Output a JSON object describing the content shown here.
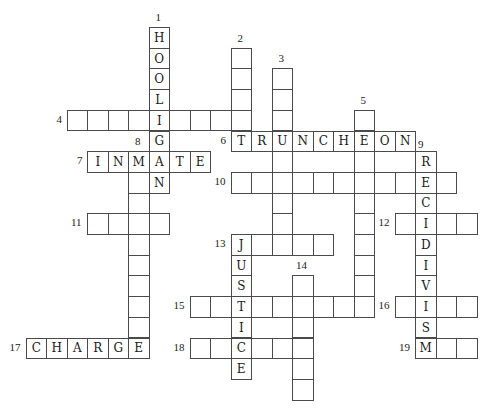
{
  "puzzle": {
    "grid": {
      "x0": 25.5,
      "y0": 27,
      "cell_w": 20.5,
      "cell_h": 20.7
    },
    "entries": [
      {
        "number": "1",
        "direction": "down",
        "row": 0,
        "col": 6,
        "length": 8,
        "letters": "HOOLIGAN",
        "label_pos": "above"
      },
      {
        "number": "2",
        "direction": "down",
        "row": 1,
        "col": 10,
        "length": 5,
        "letters": "",
        "label_pos": "above"
      },
      {
        "number": "3",
        "direction": "down",
        "row": 2,
        "col": 12,
        "length": 9,
        "letters": "",
        "label_pos": "above"
      },
      {
        "number": "4",
        "direction": "across",
        "row": 4,
        "col": 2,
        "length": 9,
        "letters": "",
        "label_pos": "left"
      },
      {
        "number": "5",
        "direction": "down",
        "row": 4,
        "col": 16,
        "length": 10,
        "letters": "",
        "label_pos": "above"
      },
      {
        "number": "6",
        "direction": "across",
        "row": 5,
        "col": 10,
        "length": 9,
        "letters": "TRUNCHEON",
        "label_pos": "left"
      },
      {
        "number": "7",
        "direction": "across",
        "row": 6,
        "col": 3,
        "length": 6,
        "letters": "INMATE",
        "label_pos": "left"
      },
      {
        "number": "8",
        "direction": "down",
        "row": 6,
        "col": 5,
        "length": 10,
        "letters": "",
        "label_pos": "above"
      },
      {
        "number": "9",
        "direction": "down",
        "row": 6,
        "col": 19,
        "length": 10,
        "letters": "RECIDIVISM",
        "label_pos": "above"
      },
      {
        "number": "10",
        "direction": "across",
        "row": 7,
        "col": 10,
        "length": 11,
        "letters": "",
        "label_pos": "left"
      },
      {
        "number": "11",
        "direction": "across",
        "row": 9,
        "col": 3,
        "length": 4,
        "letters": "",
        "label_pos": "left"
      },
      {
        "number": "12",
        "direction": "across",
        "row": 9,
        "col": 18,
        "length": 4,
        "letters": "",
        "label_pos": "left"
      },
      {
        "number": "13",
        "direction": "across",
        "row": 10,
        "col": 10,
        "length": 5,
        "letters": "",
        "label_pos": "left"
      },
      {
        "number": "",
        "direction": "down",
        "row": 10,
        "col": 10,
        "length": 7,
        "letters": "JUSTICE",
        "label_pos": "none"
      },
      {
        "number": "14",
        "direction": "down",
        "row": 12,
        "col": 13,
        "length": 6,
        "letters": "",
        "label_pos": "above"
      },
      {
        "number": "15",
        "direction": "across",
        "row": 13,
        "col": 8,
        "length": 9,
        "letters": "",
        "label_pos": "left"
      },
      {
        "number": "16",
        "direction": "across",
        "row": 13,
        "col": 18,
        "length": 4,
        "letters": "",
        "label_pos": "left"
      },
      {
        "number": "17",
        "direction": "across",
        "row": 15,
        "col": 0,
        "length": 6,
        "letters": "CHARGE",
        "label_pos": "left"
      },
      {
        "number": "18",
        "direction": "across",
        "row": 15,
        "col": 8,
        "length": 6,
        "letters": "",
        "label_pos": "left"
      },
      {
        "number": "19",
        "direction": "across",
        "row": 15,
        "col": 19,
        "length": 3,
        "letters": "",
        "label_pos": "left"
      }
    ],
    "colors": {
      "border": "#4a4a4a",
      "text": "#1a1a1a",
      "background": "#ffffff"
    }
  }
}
